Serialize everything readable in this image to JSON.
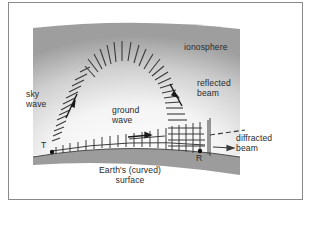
{
  "figure": {
    "labels": {
      "ionosphere": "ionosphere",
      "sky_wave_1": "sky",
      "sky_wave_2": "wave",
      "ground_wave_1": "ground",
      "ground_wave_2": "wave",
      "reflected_beam_1": "reflected",
      "reflected_beam_2": "beam",
      "diffracted_beam_1": "diffracted",
      "diffracted_beam_2": "beam",
      "transmitter": "T",
      "receiver": "R",
      "earth_1": "Earth's (curved)",
      "earth_2": "surface"
    },
    "colors": {
      "ionosphere_dark": "#9a9a9a",
      "ionosphere_light": "#ffffff",
      "earth": "#9c9c9c",
      "lines": "#3a3a3a",
      "frame_border": "#8a8a8a"
    }
  }
}
